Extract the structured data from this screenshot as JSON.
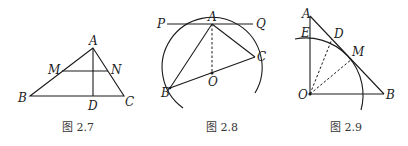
{
  "figures": [
    {
      "caption": "图 2.7",
      "points": {
        "A": "A",
        "M": "M",
        "N": "N",
        "B": "B",
        "D": "D",
        "C": "C"
      },
      "description": "Triangle ABC with altitude AD and midline MN"
    },
    {
      "caption": "图 2.8",
      "points": {
        "P": "P",
        "A": "A",
        "Q": "Q",
        "C": "C",
        "O": "O",
        "B": "B"
      },
      "description": "Circle with tangent line PQ at A, chord AB, AC, diameter BC through O, dashed AO"
    },
    {
      "caption": "图 2.9",
      "points": {
        "A": "A",
        "E": "E",
        "D": "D",
        "M": "M",
        "O": "O",
        "B": "B"
      },
      "description": "Right triangle AOB with arc centered at O tangent to AB at M, dashed OD and OM"
    }
  ]
}
